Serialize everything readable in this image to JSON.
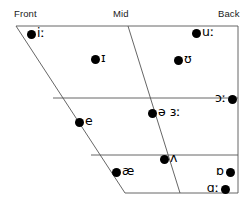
{
  "chart": {
    "axis_labels": [
      {
        "id": "front",
        "text": "Front",
        "x": 14,
        "y": 9
      },
      {
        "id": "mid",
        "text": "Mid",
        "x": 113,
        "y": 9
      },
      {
        "id": "back",
        "text": "Back",
        "x": 218,
        "y": 9
      }
    ],
    "frame": {
      "stroke": "#555555",
      "stroke_width": 0.9,
      "outline_points": "16,26 238,26 238,193 125,193",
      "horizontal_lines": [
        {
          "id": "close-mid-divider",
          "x1": 53,
          "y1": 98,
          "x2": 238,
          "y2": 98
        },
        {
          "id": "open-mid-divider",
          "x1": 91,
          "y1": 155,
          "x2": 238,
          "y2": 155
        }
      ],
      "diagonal_lines": [
        {
          "id": "central-divider",
          "x1": 128,
          "y1": 26,
          "x2": 180,
          "y2": 193
        }
      ]
    },
    "vowels": [
      {
        "id": "close-front-long",
        "symbol": "iː",
        "x": 31,
        "y": 34,
        "label_side": "right"
      },
      {
        "id": "near-close-front",
        "symbol": "ɪ",
        "x": 95,
        "y": 59,
        "label_side": "right"
      },
      {
        "id": "close-back-long",
        "symbol": "uː",
        "x": 196,
        "y": 33,
        "label_side": "right"
      },
      {
        "id": "near-close-back",
        "symbol": "ʊ",
        "x": 178,
        "y": 60,
        "label_side": "right"
      },
      {
        "id": "open-mid-back-long",
        "symbol": "ɔː",
        "x": 232,
        "y": 99,
        "label_side": "left"
      },
      {
        "id": "mid-central",
        "symbol": "ə ɜː",
        "x": 152,
        "y": 113,
        "label_side": "right"
      },
      {
        "id": "close-mid-front",
        "symbol": "e",
        "x": 79,
        "y": 122,
        "label_side": "right"
      },
      {
        "id": "open-mid-central",
        "symbol": "ʌ",
        "x": 164,
        "y": 159,
        "label_side": "right"
      },
      {
        "id": "near-open-front",
        "symbol": "æ",
        "x": 116,
        "y": 172,
        "label_side": "right"
      },
      {
        "id": "open-back-rounded",
        "symbol": "ɒ",
        "x": 230,
        "y": 172,
        "label_side": "left"
      },
      {
        "id": "open-back-long",
        "symbol": "ɑː",
        "x": 225,
        "y": 189,
        "label_side": "left"
      }
    ]
  }
}
